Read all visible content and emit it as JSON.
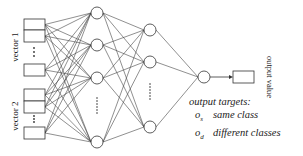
{
  "diagram": {
    "input_groups": [
      {
        "label": "vector 1",
        "ellipsis": "..."
      },
      {
        "label": "vector 2",
        "ellipsis": "..."
      }
    ],
    "hidden_layer_1": {
      "visible_nodes": 4,
      "ellipsis": "......"
    },
    "hidden_layer_2": {
      "visible_nodes": 3,
      "ellipsis": "......"
    },
    "output_node_label": "output value",
    "legend": {
      "title": "output targets:",
      "items": [
        {
          "symbol": "o",
          "subscript": "s",
          "description": "same class"
        },
        {
          "symbol": "o",
          "subscript": "d",
          "description": "different classes"
        }
      ]
    },
    "colors": {
      "stroke": "#333333",
      "background": "#ffffff"
    }
  }
}
